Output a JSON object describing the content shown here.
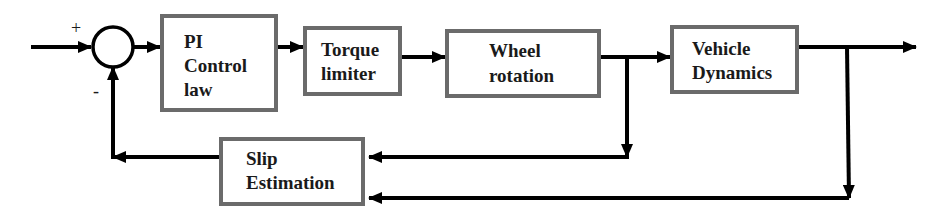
{
  "diagram": {
    "type": "block-diagram",
    "summing_junction": {
      "plus_sign": "+",
      "minus_sign": "-"
    },
    "blocks": [
      {
        "id": "pi",
        "line1": "PI",
        "line2": "Control",
        "line3": "law"
      },
      {
        "id": "torque",
        "line1": "Torque",
        "line2": "limiter"
      },
      {
        "id": "wheel",
        "line1": "Wheel",
        "line2": "rotation"
      },
      {
        "id": "vehicle",
        "line1": "Vehicle",
        "line2": "Dynamics"
      },
      {
        "id": "slip",
        "line1": "Slip",
        "line2": "Estimation"
      }
    ],
    "connections": [
      {
        "from": "input",
        "to": "summing_junction",
        "sign": "+"
      },
      {
        "from": "summing_junction",
        "to": "pi"
      },
      {
        "from": "pi",
        "to": "torque"
      },
      {
        "from": "torque",
        "to": "wheel"
      },
      {
        "from": "wheel",
        "to": "vehicle"
      },
      {
        "from": "vehicle",
        "to": "output"
      },
      {
        "from": "wheel",
        "to": "slip"
      },
      {
        "from": "vehicle",
        "to": "slip"
      },
      {
        "from": "slip",
        "to": "summing_junction",
        "sign": "-"
      }
    ],
    "colors": {
      "line": "#000000",
      "box_border": "#6b6b6b",
      "text": "#1a1a1a"
    }
  }
}
